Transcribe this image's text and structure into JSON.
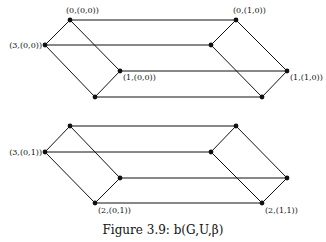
{
  "figure": {
    "caption": "Figure 3.9: b(G,U,β)"
  },
  "graphs": [
    {
      "name": "top-graph",
      "nodes": [
        {
          "id": "t0",
          "x": 70,
          "y": 20,
          "label": "(0,(0,0))",
          "lx": 66,
          "ly": 13,
          "anchor": "start"
        },
        {
          "id": "t1",
          "x": 45,
          "y": 45,
          "label": "(3,(0,0))",
          "lx": 42,
          "ly": 48,
          "anchor": "end"
        },
        {
          "id": "t2",
          "x": 120,
          "y": 71,
          "label": "(1,(0,0))",
          "lx": 123,
          "ly": 80,
          "anchor": "start"
        },
        {
          "id": "t3",
          "x": 95,
          "y": 97,
          "label": "",
          "lx": 0,
          "ly": 0,
          "anchor": "start"
        },
        {
          "id": "t4",
          "x": 236,
          "y": 20,
          "label": "(0,(1,0))",
          "lx": 233,
          "ly": 13,
          "anchor": "start"
        },
        {
          "id": "t5",
          "x": 211,
          "y": 45,
          "label": "",
          "lx": 0,
          "ly": 0,
          "anchor": "start"
        },
        {
          "id": "t6",
          "x": 287,
          "y": 71,
          "label": "(1,(1,0))",
          "lx": 290,
          "ly": 80,
          "anchor": "start"
        },
        {
          "id": "t7",
          "x": 262,
          "y": 97,
          "label": "",
          "lx": 0,
          "ly": 0,
          "anchor": "start"
        }
      ],
      "edges": [
        [
          "t0",
          "t1"
        ],
        [
          "t1",
          "t3"
        ],
        [
          "t0",
          "t2"
        ],
        [
          "t2",
          "t3"
        ],
        [
          "t4",
          "t5"
        ],
        [
          "t5",
          "t7"
        ],
        [
          "t4",
          "t6"
        ],
        [
          "t6",
          "t7"
        ],
        [
          "t0",
          "t4"
        ],
        [
          "t1",
          "t5"
        ],
        [
          "t2",
          "t6"
        ],
        [
          "t3",
          "t7"
        ]
      ]
    },
    {
      "name": "bottom-graph",
      "nodes": [
        {
          "id": "b0",
          "x": 70,
          "y": 126,
          "label": "",
          "lx": 0,
          "ly": 0,
          "anchor": "start"
        },
        {
          "id": "b1",
          "x": 45,
          "y": 152,
          "label": "(3,(0,1))",
          "lx": 42,
          "ly": 155,
          "anchor": "end"
        },
        {
          "id": "b2",
          "x": 120,
          "y": 178,
          "label": "",
          "lx": 0,
          "ly": 0,
          "anchor": "start"
        },
        {
          "id": "b3",
          "x": 95,
          "y": 203,
          "label": "(2,(0,1))",
          "lx": 98,
          "ly": 213,
          "anchor": "start"
        },
        {
          "id": "b4",
          "x": 236,
          "y": 126,
          "label": "",
          "lx": 0,
          "ly": 0,
          "anchor": "start"
        },
        {
          "id": "b5",
          "x": 211,
          "y": 152,
          "label": "",
          "lx": 0,
          "ly": 0,
          "anchor": "start"
        },
        {
          "id": "b6",
          "x": 287,
          "y": 178,
          "label": "",
          "lx": 0,
          "ly": 0,
          "anchor": "start"
        },
        {
          "id": "b7",
          "x": 262,
          "y": 203,
          "label": "(2,(1,1))",
          "lx": 265,
          "ly": 213,
          "anchor": "start"
        }
      ],
      "edges": [
        [
          "b0",
          "b1"
        ],
        [
          "b1",
          "b3"
        ],
        [
          "b0",
          "b2"
        ],
        [
          "b2",
          "b3"
        ],
        [
          "b4",
          "b5"
        ],
        [
          "b5",
          "b7"
        ],
        [
          "b4",
          "b6"
        ],
        [
          "b6",
          "b7"
        ],
        [
          "b0",
          "b4"
        ],
        [
          "b1",
          "b5"
        ],
        [
          "b2",
          "b6"
        ],
        [
          "b3",
          "b7"
        ]
      ]
    }
  ]
}
